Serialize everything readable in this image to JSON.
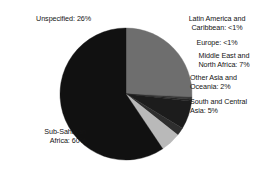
{
  "chart_data": {
    "type": "pie",
    "title": "",
    "subtitle": "",
    "xlabel": "",
    "ylabel": "",
    "legend_position": "callout-labels",
    "grid": false,
    "categories": [
      "Unspecified",
      "Latin America and Caribbean",
      "Europe",
      "Middle East and North Africa",
      "Other Asia and Oceania",
      "South and Central Asia",
      "Sub-Saharan Africa"
    ],
    "values": [
      26,
      0.5,
      0.5,
      7,
      2,
      5,
      60
    ],
    "value_labels": [
      "26%",
      "<1%",
      "<1%",
      "7%",
      "2%",
      "5%",
      "60%"
    ],
    "colors": [
      "#6e6e6e",
      "#3a3a3a",
      "#262626",
      "#1c1c1c",
      "#2e2e2e",
      "#b9b9b9",
      "#111111"
    ],
    "annotations": [
      {
        "id": "unspecified",
        "text": "Unspecified: 26%"
      },
      {
        "id": "latin",
        "text": "Latin America and\nCaribbean: <1%"
      },
      {
        "id": "europe",
        "text": "Europe: <1%"
      },
      {
        "id": "mena",
        "text": "Middle East and\nNorth Africa: 7%"
      },
      {
        "id": "otherasia",
        "text": "Other Asia and\nOceania: 2%"
      },
      {
        "id": "southcentral",
        "text": "South and Central\nAsia: 5%"
      },
      {
        "id": "subsaharan",
        "text": "Sub-Saharan\nAfrica: 60%"
      }
    ],
    "geometry": {
      "center_x": 126,
      "center_y": 94,
      "radius": 66,
      "start_angle_deg": -90
    }
  },
  "slices": {
    "unspecified": {
      "label": "Unspecified: 26%"
    },
    "latin": {
      "label": "Latin America and\nCaribbean: <1%"
    },
    "europe": {
      "label": "Europe: <1%"
    },
    "mena": {
      "label": "Middle East and\nNorth Africa: 7%"
    },
    "otherasia": {
      "label": "Other Asia and\nOceania: 2%"
    },
    "southcentral": {
      "label": "South and Central\nAsia: 5%"
    },
    "subsaharan": {
      "label": "Sub-Saharan\nAfrica: 60%"
    }
  }
}
